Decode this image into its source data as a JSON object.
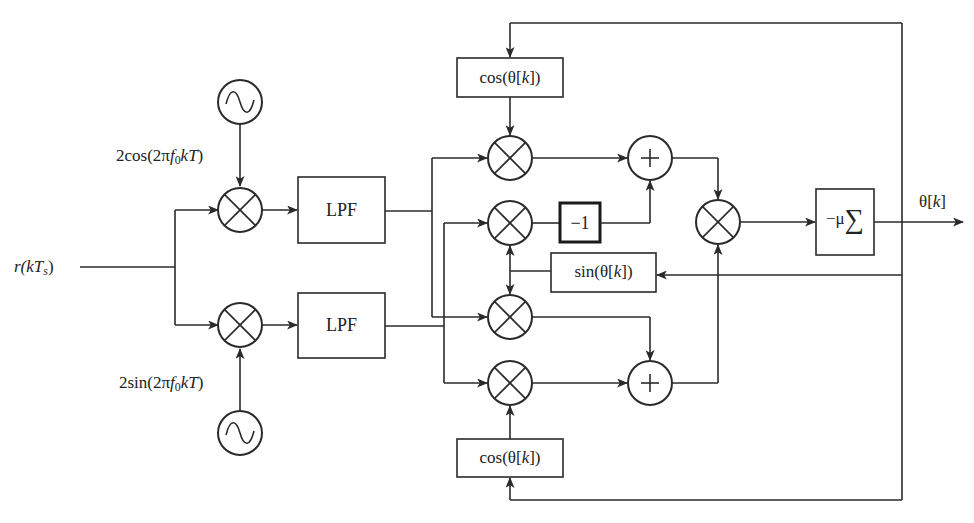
{
  "input": {
    "label_prefix": "r(",
    "label_var": "kT",
    "label_sub": "s",
    "label_suffix": ")"
  },
  "oscillators": [
    {
      "id": "osc-cos",
      "symbol": "~",
      "label_pre": "2cos(2π",
      "label_f": "f",
      "label_fsub": "0",
      "label_post": "kT",
      "label_end": ")"
    },
    {
      "id": "osc-sin",
      "symbol": "~",
      "label_pre": "2sin(2π",
      "label_f": "f",
      "label_fsub": "0",
      "label_post": "kT",
      "label_end": ")"
    }
  ],
  "filters": [
    {
      "id": "lpf-top",
      "label": "LPF"
    },
    {
      "id": "lpf-bottom",
      "label": "LPF"
    }
  ],
  "blocks": {
    "cos_top": {
      "pre": "cos(θ[",
      "var": "k",
      "post": "])"
    },
    "cos_bottom": {
      "pre": "cos(θ[",
      "var": "k",
      "post": "])"
    },
    "sin": {
      "pre": "sin(θ[",
      "var": "k",
      "post": "])"
    },
    "neg_one": "−1",
    "integrator_prefix": "−μ",
    "integrator_symbol": "∑"
  },
  "output": {
    "pre": "θ[",
    "var": "k",
    "post": "]"
  },
  "symbols": {
    "multiply": "⊗",
    "add": "+"
  },
  "colors": {
    "line": "#2a2a2a",
    "background": "#ffffff"
  }
}
